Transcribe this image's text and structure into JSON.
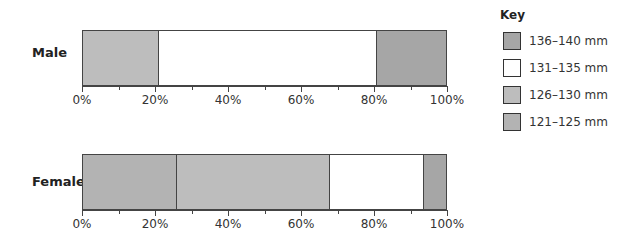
{
  "chart_data": {
    "type": "bar",
    "orientation": "horizontal",
    "stacked": "percentage",
    "title": "",
    "xlabel": "",
    "ylabel": "",
    "xlim": [
      0,
      100
    ],
    "x_ticks": [
      "0%",
      "20%",
      "40%",
      "60%",
      "80%",
      "100%"
    ],
    "categories": [
      "Male",
      "Female"
    ],
    "series": [
      {
        "name": "121–125 mm",
        "color": "#b3b3b3",
        "values": [
          0,
          26
        ]
      },
      {
        "name": "126–130 mm",
        "color": "#bdbdbd",
        "values": [
          21,
          42
        ]
      },
      {
        "name": "131–135 mm",
        "color": "#ffffff",
        "values": [
          60,
          26
        ]
      },
      {
        "name": "136–140 mm",
        "color": "#a6a6a6",
        "values": [
          19,
          6
        ]
      }
    ],
    "legend": {
      "title": "Key",
      "position": "right",
      "entries": [
        "136–140 mm",
        "131–135 mm",
        "126–130 mm",
        "121–125 mm"
      ]
    }
  },
  "labels": {
    "male": "Male",
    "female": "Female",
    "key_title": "Key",
    "ticks": [
      "0%",
      "20%",
      "40%",
      "60%",
      "80%",
      "100%"
    ],
    "key": [
      {
        "label": "136–140 mm",
        "color": "#a6a6a6"
      },
      {
        "label": "131–135 mm",
        "color": "#ffffff"
      },
      {
        "label": "126–130 mm",
        "color": "#bdbdbd"
      },
      {
        "label": "121–125 mm",
        "color": "#b3b3b3"
      }
    ]
  }
}
